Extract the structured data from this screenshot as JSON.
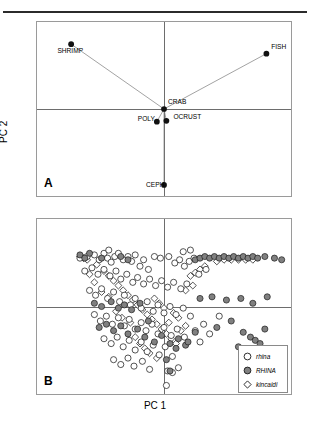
{
  "figure": {
    "axis_x_label": "PC 1",
    "axis_y_label": "PC 2",
    "panels": [
      {
        "letter": "A"
      },
      {
        "letter": "B"
      }
    ]
  },
  "legend": {
    "items": [
      {
        "label": "rhina",
        "marker": "open-circle",
        "fill": "#ffffff",
        "stroke": "#1a1a1a"
      },
      {
        "label": "RHINA",
        "marker": "filled-circle",
        "fill": "#808080",
        "stroke": "#1a1a1a"
      },
      {
        "label": "kincaidi",
        "marker": "open-diamond",
        "fill": "#ffffff",
        "stroke": "#1a1a1a"
      }
    ]
  },
  "colors": {
    "frame": "#9a9a9a",
    "axis": "#6d6d6d",
    "rule": "#2b2b2b",
    "vector": "#7a7a7a",
    "marker_dark": "#111111",
    "marker_gray": "#808080"
  },
  "chart_data": [
    {
      "type": "scatter",
      "panel": "A",
      "title": "",
      "xlabel": "PC 1",
      "ylabel": "PC 2",
      "xlim": [
        -1,
        1
      ],
      "ylim": [
        -1,
        1
      ],
      "grid": false,
      "axis_lines": {
        "x_at": 0,
        "y_at": 0
      },
      "description": "PCA loading plot of prey categories; lines connect each prey point to the central CRAB point",
      "points": [
        {
          "label": "SHRIMP",
          "x": -0.78,
          "y": 0.82,
          "label_pos": "below-left"
        },
        {
          "label": "FISH",
          "x": 0.86,
          "y": 0.7,
          "label_pos": "above-right"
        },
        {
          "label": "CRAB",
          "x": 0.0,
          "y": 0.0,
          "label_pos": "above-right"
        },
        {
          "label": "OCRUST",
          "x": 0.02,
          "y": -0.15,
          "label_pos": "right"
        },
        {
          "label": "POLY",
          "x": -0.06,
          "y": -0.16,
          "label_pos": "left"
        },
        {
          "label": "CEPH",
          "x": 0.0,
          "y": -0.96,
          "label_pos": "left"
        }
      ],
      "vectors": [
        {
          "from": "CRAB",
          "to": "SHRIMP"
        },
        {
          "from": "CRAB",
          "to": "FISH"
        },
        {
          "from": "CRAB",
          "to": "POLY"
        },
        {
          "from": "CRAB",
          "to": "OCRUST"
        },
        {
          "from": "CRAB",
          "to": "CEPH"
        }
      ]
    },
    {
      "type": "scatter",
      "panel": "B",
      "title": "",
      "xlabel": "PC 1",
      "ylabel": "PC 2",
      "xlim": [
        -1,
        1
      ],
      "ylim": [
        -1,
        1
      ],
      "grid": false,
      "axis_lines": {
        "x_at": 0,
        "y_at": 0
      },
      "legend_position": "bottom-right",
      "description": "PCA scores of individual specimens for three groups",
      "series": [
        {
          "name": "rhina",
          "marker": "open-circle",
          "points": [
            [
              -0.7,
              0.6
            ],
            [
              -0.64,
              0.62
            ],
            [
              -0.58,
              0.64
            ],
            [
              -0.54,
              0.58
            ],
            [
              -0.5,
              0.66
            ],
            [
              -0.47,
              0.6
            ],
            [
              -0.44,
              0.55
            ],
            [
              -0.41,
              0.62
            ],
            [
              -0.38,
              0.66
            ],
            [
              -0.34,
              0.58
            ],
            [
              -0.3,
              0.62
            ],
            [
              -0.27,
              0.56
            ],
            [
              -0.24,
              0.64
            ],
            [
              -0.2,
              0.5
            ],
            [
              -0.17,
              0.58
            ],
            [
              -0.13,
              0.46
            ],
            [
              -0.08,
              0.62
            ],
            [
              -0.03,
              0.6
            ],
            [
              0.04,
              0.62
            ],
            [
              0.09,
              0.54
            ],
            [
              0.13,
              0.58
            ],
            [
              0.17,
              0.5
            ],
            [
              0.21,
              0.56
            ],
            [
              0.25,
              0.6
            ],
            [
              -0.66,
              0.44
            ],
            [
              -0.6,
              0.48
            ],
            [
              -0.55,
              0.4
            ],
            [
              -0.5,
              0.46
            ],
            [
              -0.45,
              0.38
            ],
            [
              -0.4,
              0.44
            ],
            [
              -0.36,
              0.34
            ],
            [
              -0.31,
              0.4
            ],
            [
              -0.26,
              0.3
            ],
            [
              -0.22,
              0.36
            ],
            [
              -0.17,
              0.28
            ],
            [
              -0.12,
              0.34
            ],
            [
              -0.07,
              0.26
            ],
            [
              -0.02,
              0.32
            ],
            [
              0.03,
              0.24
            ],
            [
              0.08,
              0.3
            ],
            [
              0.14,
              0.22
            ],
            [
              0.19,
              0.28
            ],
            [
              -0.62,
              0.2
            ],
            [
              -0.57,
              0.14
            ],
            [
              -0.52,
              0.22
            ],
            [
              -0.47,
              0.1
            ],
            [
              -0.42,
              0.18
            ],
            [
              -0.37,
              0.06
            ],
            [
              -0.33,
              0.14
            ],
            [
              -0.28,
              0.02
            ],
            [
              -0.24,
              0.1
            ],
            [
              -0.19,
              -0.02
            ],
            [
              -0.14,
              0.06
            ],
            [
              -0.09,
              -0.06
            ],
            [
              -0.05,
              0.02
            ],
            [
              0.0,
              -0.08
            ],
            [
              0.05,
              0.0
            ],
            [
              0.1,
              -0.1
            ],
            [
              0.16,
              -0.02
            ],
            [
              0.22,
              -0.12
            ],
            [
              -0.58,
              -0.1
            ],
            [
              -0.53,
              -0.18
            ],
            [
              -0.48,
              -0.12
            ],
            [
              -0.43,
              -0.22
            ],
            [
              -0.38,
              -0.14
            ],
            [
              -0.33,
              -0.24
            ],
            [
              -0.29,
              -0.16
            ],
            [
              -0.24,
              -0.28
            ],
            [
              -0.19,
              -0.2
            ],
            [
              -0.15,
              -0.3
            ],
            [
              -0.1,
              -0.22
            ],
            [
              -0.05,
              -0.34
            ],
            [
              0.0,
              -0.26
            ],
            [
              0.06,
              -0.36
            ],
            [
              0.11,
              -0.28
            ],
            [
              0.17,
              -0.38
            ],
            [
              0.26,
              -0.3
            ],
            [
              0.33,
              -0.22
            ],
            [
              -0.5,
              -0.4
            ],
            [
              -0.44,
              -0.46
            ],
            [
              -0.39,
              -0.38
            ],
            [
              -0.34,
              -0.5
            ],
            [
              -0.29,
              -0.42
            ],
            [
              -0.24,
              -0.54
            ],
            [
              -0.19,
              -0.44
            ],
            [
              -0.14,
              -0.56
            ],
            [
              -0.09,
              -0.48
            ],
            [
              -0.04,
              -0.6
            ],
            [
              0.01,
              -0.5
            ],
            [
              0.07,
              -0.62
            ],
            [
              -0.42,
              -0.66
            ],
            [
              -0.36,
              -0.72
            ],
            [
              -0.3,
              -0.64
            ],
            [
              -0.25,
              -0.74
            ],
            [
              -0.18,
              -0.68
            ],
            [
              -0.12,
              -0.78
            ],
            [
              0.03,
              -0.8
            ],
            [
              0.07,
              -0.82
            ],
            [
              0.12,
              -0.76
            ],
            [
              0.02,
              -0.98
            ],
            [
              0.3,
              -0.44
            ],
            [
              0.38,
              -0.34
            ],
            [
              0.46,
              -0.12
            ],
            [
              0.29,
              0.4
            ],
            [
              0.35,
              0.46
            ],
            [
              0.16,
              0.68
            ],
            [
              0.22,
              0.7
            ],
            [
              -0.46,
              0.7
            ]
          ]
        },
        {
          "name": "RHINA",
          "marker": "filled-circle",
          "points": [
            [
              -0.7,
              0.64
            ],
            [
              -0.66,
              0.6
            ],
            [
              -0.62,
              0.66
            ],
            [
              -0.52,
              0.6
            ],
            [
              -0.36,
              0.62
            ],
            [
              -0.3,
              0.58
            ],
            [
              -0.58,
              0.04
            ],
            [
              -0.52,
              0.0
            ],
            [
              -0.44,
              0.06
            ],
            [
              -0.38,
              -0.02
            ],
            [
              -0.33,
              0.02
            ],
            [
              -0.27,
              -0.04
            ],
            [
              -0.54,
              -0.26
            ],
            [
              -0.48,
              -0.22
            ],
            [
              -0.42,
              -0.3
            ],
            [
              -0.36,
              -0.24
            ],
            [
              -0.3,
              -0.34
            ],
            [
              -0.22,
              -0.28
            ],
            [
              -0.16,
              -0.38
            ],
            [
              -0.08,
              -0.44
            ],
            [
              -0.02,
              -0.36
            ],
            [
              0.05,
              -0.46
            ],
            [
              0.12,
              -0.4
            ],
            [
              0.18,
              -0.48
            ],
            [
              0.26,
              0.58
            ],
            [
              0.3,
              0.6
            ],
            [
              0.34,
              0.62
            ],
            [
              0.38,
              0.6
            ],
            [
              0.42,
              0.62
            ],
            [
              0.46,
              0.6
            ],
            [
              0.5,
              0.62
            ],
            [
              0.54,
              0.6
            ],
            [
              0.58,
              0.62
            ],
            [
              0.62,
              0.6
            ],
            [
              0.66,
              0.62
            ],
            [
              0.7,
              0.6
            ],
            [
              0.74,
              0.62
            ],
            [
              0.78,
              0.6
            ],
            [
              0.84,
              0.62
            ],
            [
              0.92,
              0.6
            ],
            [
              0.98,
              0.58
            ],
            [
              0.3,
              0.1
            ],
            [
              0.4,
              0.12
            ],
            [
              0.52,
              0.08
            ],
            [
              0.64,
              0.1
            ],
            [
              0.74,
              0.04
            ],
            [
              0.86,
              0.12
            ],
            [
              0.44,
              -0.26
            ],
            [
              0.56,
              -0.18
            ],
            [
              0.66,
              -0.32
            ],
            [
              0.72,
              -0.38
            ],
            [
              0.76,
              -0.42
            ],
            [
              0.8,
              -0.46
            ],
            [
              0.84,
              -0.28
            ],
            [
              0.62,
              -0.5
            ],
            [
              0.26,
              -0.32
            ],
            [
              0.2,
              -0.44
            ],
            [
              0.1,
              -0.52
            ],
            [
              0.05,
              -0.8
            ],
            [
              -0.2,
              0.04
            ],
            [
              -0.13,
              -0.18
            ],
            [
              0.02,
              -0.66
            ]
          ]
        },
        {
          "name": "kincaidi",
          "marker": "open-diamond",
          "points": [
            [
              -0.7,
              0.62
            ],
            [
              -0.67,
              0.6
            ],
            [
              -0.64,
              0.58
            ],
            [
              -0.56,
              0.52
            ],
            [
              -0.5,
              0.44
            ],
            [
              -0.46,
              0.38
            ],
            [
              -0.42,
              0.32
            ],
            [
              -0.38,
              0.26
            ],
            [
              -0.34,
              0.2
            ],
            [
              -0.3,
              0.14
            ],
            [
              -0.26,
              0.08
            ],
            [
              -0.22,
              0.02
            ],
            [
              -0.18,
              -0.04
            ],
            [
              -0.14,
              -0.1
            ],
            [
              -0.1,
              -0.16
            ],
            [
              -0.06,
              -0.22
            ],
            [
              -0.02,
              -0.28
            ],
            [
              0.02,
              -0.34
            ],
            [
              0.06,
              -0.4
            ],
            [
              0.1,
              -0.46
            ],
            [
              0.14,
              -0.3
            ],
            [
              0.18,
              -0.24
            ],
            [
              0.22,
              0.38
            ],
            [
              0.26,
              0.42
            ],
            [
              0.3,
              0.46
            ],
            [
              0.34,
              0.5
            ],
            [
              0.44,
              0.56
            ],
            [
              0.5,
              0.58
            ],
            [
              0.56,
              0.58
            ],
            [
              0.62,
              0.58
            ],
            [
              0.68,
              0.58
            ],
            [
              0.74,
              0.58
            ],
            [
              -0.52,
              0.18
            ],
            [
              -0.46,
              0.12
            ],
            [
              -0.4,
              -0.06
            ],
            [
              -0.35,
              -0.14
            ],
            [
              -0.28,
              -0.2
            ],
            [
              -0.24,
              -0.38
            ],
            [
              -0.2,
              -0.46
            ],
            [
              -0.16,
              -0.52
            ],
            [
              -0.12,
              -0.58
            ],
            [
              -0.06,
              -0.64
            ],
            [
              0.04,
              -0.2
            ],
            [
              0.12,
              -0.14
            ],
            [
              0.18,
              0.2
            ],
            [
              0.24,
              0.26
            ],
            [
              -0.58,
              0.3
            ],
            [
              -0.62,
              0.4
            ],
            [
              -0.08,
              0.1
            ],
            [
              -0.04,
              0.04
            ],
            [
              0.0,
              -0.02
            ],
            [
              0.08,
              -0.08
            ]
          ]
        }
      ]
    }
  ]
}
